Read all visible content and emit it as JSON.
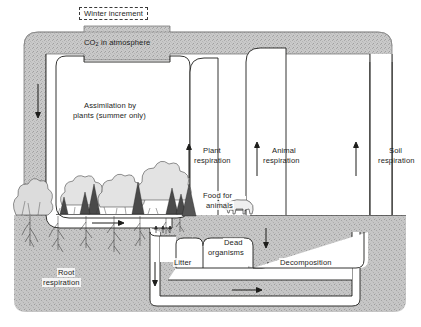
{
  "figure": {
    "type": "process-flow-diagram"
  },
  "labels": {
    "winter_increment": "Winter increment",
    "co2_atmosphere_pre": "CO",
    "co2_atmosphere_sub": "2",
    "co2_atmosphere_post": " in atmosphere",
    "assimilation_line1": "Assimilation by",
    "assimilation_line2": "plants (summer only)",
    "plant_respiration_line1": "Plant",
    "plant_respiration_line2": "respiration",
    "animal_respiration_line1": "Animal",
    "animal_respiration_line2": "respiration",
    "soil_respiration_line1": "Soil",
    "soil_respiration_line2": "respiration",
    "food_for_animals_line1": "Food for",
    "food_for_animals_line2": "animals",
    "dead_organisms_line1": "Dead",
    "dead_organisms_line2": "organisms",
    "litter": "Litter",
    "decomposition": "Decomposition",
    "root_respiration_line1": "Root",
    "root_respiration_line2": "respiration"
  },
  "colors": {
    "atmosphere_band": "#b3b3b3",
    "soil_block": "#c2c2c2",
    "channel_fill": "#ffffff",
    "outline": "#1d1d1b",
    "text": "#1d1d1b",
    "page_background": "#ffffff",
    "dashed_box_border": "#3a3a3a"
  },
  "flow_arrows": [
    {
      "name": "co2-to-assimilation",
      "direction": "down",
      "label": "CO2 into plants"
    },
    {
      "name": "assimilation-to-ground",
      "direction": "right",
      "label": "assimilation flow"
    },
    {
      "name": "plant-respiration-up",
      "direction": "up",
      "label": "Plant respiration"
    },
    {
      "name": "animal-respiration-up",
      "direction": "up",
      "label": "Animal respiration"
    },
    {
      "name": "soil-respiration-up",
      "direction": "up",
      "label": "Soil respiration"
    },
    {
      "name": "litter-down",
      "direction": "down",
      "label": "Litter"
    },
    {
      "name": "dead-organisms-down",
      "direction": "down",
      "label": "Dead organisms"
    },
    {
      "name": "decomposition-right",
      "direction": "right",
      "label": "Decomposition"
    }
  ]
}
